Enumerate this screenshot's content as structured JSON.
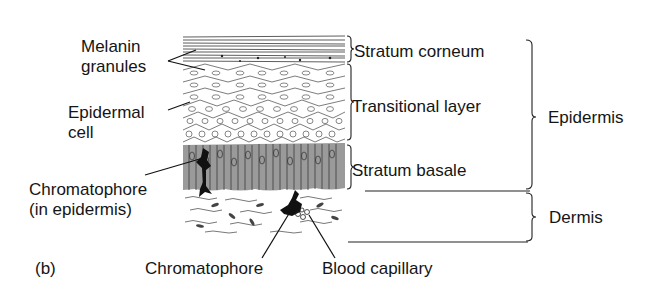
{
  "figure": {
    "panel_label": "(b)"
  },
  "labels_left": {
    "melanin_granules": [
      "Melanin",
      "granules"
    ],
    "epidermal_cell": [
      "Epidermal",
      "cell"
    ],
    "chromatophore_epidermis": [
      "Chromatophore",
      "(in epidermis)"
    ]
  },
  "labels_bottom": {
    "chromatophore": "Chromatophore",
    "blood_capillary": "Blood capillary"
  },
  "layers": [
    {
      "name": "Stratum corneum"
    },
    {
      "name": "Transitional layer"
    },
    {
      "name": "Stratum basale"
    }
  ],
  "regions": [
    {
      "name": "Epidermis"
    },
    {
      "name": "Dermis"
    }
  ],
  "colors": {
    "ink": "#151515",
    "basale_fill": "#9a9a9a",
    "background": "#ffffff"
  }
}
